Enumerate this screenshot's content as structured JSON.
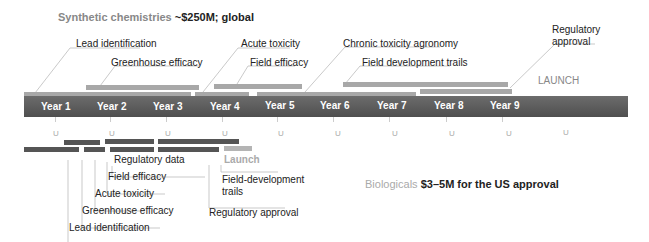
{
  "header": {
    "synthetic_label": "Synthetic chemistries",
    "synthetic_cost": "~$250M; global"
  },
  "synthetic_stages": [
    {
      "label": "Lead identification"
    },
    {
      "label": "Greenhouse efficacy"
    },
    {
      "label": "Acute toxicity"
    },
    {
      "label": "Field efficacy"
    },
    {
      "label": "Chronic toxicity agronomy"
    },
    {
      "label": "Field development trails"
    },
    {
      "label": "Regulatory approval"
    }
  ],
  "launch_label": "LAUNCH",
  "timeline": {
    "years": [
      "Year 1",
      "Year 2",
      "Year 3",
      "Year 4",
      "Year 5",
      "Year 6",
      "Year 7",
      "Year 8",
      "Year 9"
    ],
    "tick_marker": "U"
  },
  "biological_stages": [
    {
      "label": "Regulatory data"
    },
    {
      "label": "Field efficacy"
    },
    {
      "label": "Acute toxicity"
    },
    {
      "label": "Greenhouse efficacy"
    },
    {
      "label": "Lead identification"
    },
    {
      "label": "Launch"
    },
    {
      "label": "Field-development"
    },
    {
      "label": "trails"
    },
    {
      "label": "Regulatory approval"
    }
  ],
  "footer": {
    "biological_label": "Biologicals",
    "biological_cost": "$3–5M for the US approval"
  },
  "colors": {
    "timeline": "#5a5a5a",
    "synthetic_bar": "#a8a8a8",
    "biological_bar": "#555555",
    "muted_text": "#888888"
  }
}
